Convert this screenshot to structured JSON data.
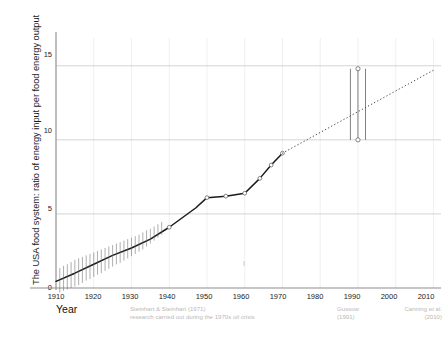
{
  "axes": {
    "ylabel": "The USA food system: ratio of energy input per food energy output",
    "xlabel": "Year",
    "yticks": [
      "0",
      "5",
      "10",
      "15"
    ],
    "xticks": [
      "1910",
      "1920",
      "1930",
      "1940",
      "1950",
      "1960",
      "1970",
      "1980",
      "1990",
      "2000",
      "2010"
    ]
  },
  "annotations": {
    "steinhart": "Steinhart & Steinhart (1971)\nresearch carried out during the 1970s oil crisis",
    "gussow": "Gussow\n(1991)",
    "canning": "Canning et al.\n(2010)"
  },
  "colors": {
    "line": "#1a1a1a",
    "grid": "#c9c9c9",
    "grid_minor": "#ececec",
    "axis": "#8d8d8d",
    "annotation": "#b9b9b9",
    "marker_fill": "#ffffff",
    "marker_stroke": "#555555"
  },
  "chart_data": {
    "type": "line",
    "title": "",
    "xlabel": "Year",
    "ylabel": "The USA food system: ratio of energy input per food energy output",
    "xlim": [
      1910,
      2012
    ],
    "ylim": [
      0,
      16.2
    ],
    "yticks": [
      0,
      5,
      10,
      15
    ],
    "xticks": [
      1910,
      1920,
      1930,
      1940,
      1950,
      1960,
      1970,
      1980,
      1990,
      2000,
      2010
    ],
    "grid": true,
    "legend": "none",
    "series": [
      {
        "name": "Steinhart & Steinhart measured (solid)",
        "style": "solid",
        "x": [
          1910,
          1915,
          1920,
          1925,
          1930,
          1935,
          1940,
          1947,
          1950,
          1955,
          1960,
          1964,
          1967,
          1970
        ],
        "y": [
          0.45,
          1.0,
          1.6,
          2.2,
          2.7,
          3.3,
          4.1,
          5.4,
          6.1,
          6.2,
          6.4,
          7.4,
          8.3,
          9.1
        ],
        "markers_x": [
          1940,
          1950,
          1955,
          1960,
          1964,
          1967,
          1970
        ],
        "markers_y": [
          4.1,
          6.1,
          6.2,
          6.4,
          7.4,
          8.3,
          9.1
        ]
      },
      {
        "name": "Extrapolation to Canning et al. (dotted)",
        "style": "dotted",
        "x": [
          1970,
          2010
        ],
        "y": [
          9.1,
          14.7
        ]
      },
      {
        "name": "Annual yearly variation whiskers (1910-1935)",
        "style": "whiskers",
        "x": [
          1911,
          1912,
          1913,
          1914,
          1915,
          1916,
          1917,
          1918,
          1919,
          1920,
          1921,
          1922,
          1923,
          1924,
          1925,
          1926,
          1927,
          1928,
          1929,
          1930,
          1931,
          1932,
          1933,
          1934,
          1935,
          1936,
          1937,
          1938
        ],
        "y_top": [
          1.35,
          1.5,
          1.6,
          1.75,
          1.9,
          2.0,
          2.1,
          2.2,
          2.3,
          2.4,
          2.5,
          2.6,
          2.7,
          2.8,
          2.9,
          3.0,
          3.1,
          3.2,
          3.3,
          3.4,
          3.5,
          3.6,
          3.75,
          3.9,
          4.0,
          4.15,
          4.3,
          4.45
        ],
        "y_bottom": [
          -0.3,
          -0.2,
          -0.1,
          0.0,
          0.1,
          0.2,
          0.35,
          0.5,
          0.6,
          0.75,
          0.9,
          1.0,
          1.15,
          1.3,
          1.45,
          1.6,
          1.7,
          1.85,
          2.0,
          2.15,
          2.3,
          2.45,
          2.6,
          2.8,
          3.0,
          3.2,
          3.4,
          3.6
        ]
      },
      {
        "name": "Gussow (1991) range",
        "style": "errorbar",
        "x": [
          1988,
          1990,
          1992
        ],
        "y_top": [
          14.8,
          14.8,
          14.8
        ],
        "y_bottom": [
          10.0,
          10.0,
          10.0
        ],
        "markers_x": [
          1990,
          1990
        ],
        "markers_y": [
          14.8,
          10.0
        ]
      }
    ],
    "notes": [
      "Steinhart & Steinhart (1971) research carried out during the 1970s oil crisis",
      "Gussow (1991)",
      "Canning et al. (2010)"
    ]
  }
}
